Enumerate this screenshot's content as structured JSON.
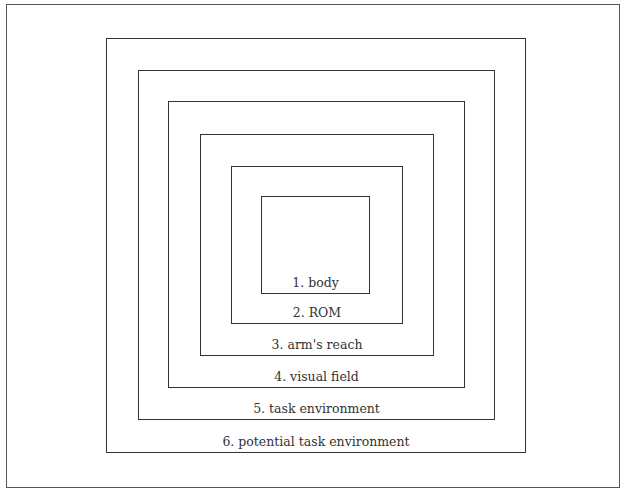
{
  "diagram": {
    "type": "nested-boxes",
    "levels": [
      {
        "id": 1,
        "label": "1. body",
        "box": {
          "x": 261,
          "y": 196,
          "w": 109,
          "h": 98
        }
      },
      {
        "id": 2,
        "label": "2. ROM",
        "box": {
          "x": 231,
          "y": 166,
          "w": 172,
          "h": 158
        }
      },
      {
        "id": 3,
        "label": "3. arm's reach",
        "box": {
          "x": 200,
          "y": 134,
          "w": 234,
          "h": 222
        }
      },
      {
        "id": 4,
        "label": "4. visual field",
        "box": {
          "x": 168,
          "y": 101,
          "w": 297,
          "h": 287
        }
      },
      {
        "id": 5,
        "label": "5. task environment",
        "box": {
          "x": 138,
          "y": 70,
          "w": 357,
          "h": 350
        }
      },
      {
        "id": 6,
        "label": "6. potential task environment",
        "box": {
          "x": 106,
          "y": 38,
          "w": 420,
          "h": 415
        }
      }
    ]
  }
}
